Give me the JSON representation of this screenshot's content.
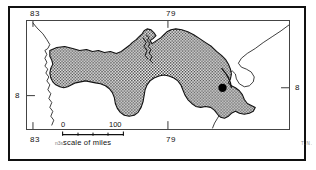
{
  "figure": {
    "type": "reference-map",
    "region": "Panama",
    "title": ""
  },
  "graticule": {
    "top": [
      {
        "label": "83",
        "name": "longitude-83-top"
      },
      {
        "label": "79",
        "name": "longitude-79-top"
      }
    ],
    "bottom": [
      {
        "label": "83",
        "name": "longitude-83-bottom"
      },
      {
        "label": "79",
        "name": "longitude-79-bottom"
      }
    ],
    "left": [
      {
        "label": "8",
        "name": "latitude-8-left"
      }
    ],
    "right": [
      {
        "label": "8",
        "name": "latitude-8-right"
      }
    ]
  },
  "scale": {
    "min_label": "0",
    "max_label": "100",
    "caption": "scale of miles",
    "segments": 4
  },
  "marks": {
    "bottom_left_plate": "n3s",
    "bottom_right_plate": "T.N."
  },
  "colors": {
    "ink": "#111111",
    "frame": "#444444",
    "land_fill_dot": "#000000",
    "paper": "#ffffff",
    "faint": "#888888"
  },
  "map_features": {
    "shaded_country_label": "Panama",
    "city_marker_label": "",
    "coastline_label": ""
  }
}
